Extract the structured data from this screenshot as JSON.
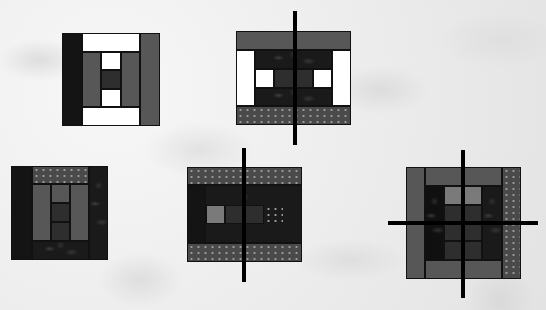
{
  "colors": {
    "white": "#ffffff",
    "black": "#141414",
    "gray": "#575757",
    "light_gray": "#7a7a7a",
    "dark_fabric": "#1a1a1a",
    "dotted_fabric": "#4a4a4a",
    "cut_line": "#000000",
    "background": "#eeeeee"
  },
  "blocks": [
    {
      "id": "block-1",
      "cut_lines": "none"
    },
    {
      "id": "block-2",
      "cut_lines": "vertical"
    },
    {
      "id": "block-3",
      "cut_lines": "none"
    },
    {
      "id": "block-4",
      "cut_lines": "vertical"
    },
    {
      "id": "block-5",
      "cut_lines": "vertical-and-horizontal"
    }
  ]
}
